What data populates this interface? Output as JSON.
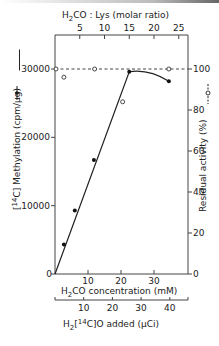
{
  "chart_data": {
    "type": "line",
    "title": "",
    "top_axis": {
      "label": "H2CO : Lys (molar ratio)",
      "ticks": [
        "5",
        "10",
        "15",
        "20",
        "25"
      ]
    },
    "xlabel": "H2CO concentration (mM)",
    "x_ticks": [
      "10",
      "20",
      "30"
    ],
    "second_x_axis": {
      "label": "H2[14C]O added (µCi)",
      "ticks": [
        "10",
        "20",
        "30",
        "40"
      ]
    },
    "ylabel": "[14C] Methylation (cpm/µg)",
    "y_ticks": [
      "0",
      "10000",
      "20000",
      "30000"
    ],
    "ylim": [
      0,
      35000
    ],
    "y2label": "Residual activity (%)",
    "y2_ticks": [
      "0",
      "20",
      "40",
      "60",
      "80",
      "100"
    ],
    "y2lim": [
      0,
      117
    ],
    "xlim": [
      0,
      40
    ],
    "grid": false,
    "series": [
      {
        "name": "[14C] Methylation",
        "marker": "filled-circle",
        "axis": "left",
        "x": [
          2.7,
          6.0,
          11.8,
          22.5,
          34.5
        ],
        "values": [
          4300,
          9300,
          16700,
          29600,
          28200
        ]
      },
      {
        "name": "Residual activity",
        "marker": "open-circle",
        "axis": "right",
        "x": [
          0,
          2.7,
          12.0,
          20.5,
          34.5
        ],
        "values": [
          100,
          96,
          100,
          84,
          100
        ]
      }
    ],
    "annotations": [
      "Dashed reference line at 100% residual activity"
    ]
  },
  "labels": {
    "top_axis_label_a": "H",
    "top_axis_label_sub": "2",
    "top_axis_label_b": "CO : Lys (molar ratio)",
    "x_label_a": "H",
    "x_label_sub": "2",
    "x_label_b": "CO concentration (mM)",
    "x2_label_a": "H",
    "x2_label_sub": "2",
    "x2_label_b": "[",
    "x2_label_sup": "14",
    "x2_label_c": "C]O added (µCi)",
    "y_label_a": "[",
    "y_label_sup": "14",
    "y_label_b": "C] Methylation (cpm/µg)",
    "y2_label": "Residual activity (%)",
    "y_origin": "0",
    "y2_origin": "0"
  }
}
